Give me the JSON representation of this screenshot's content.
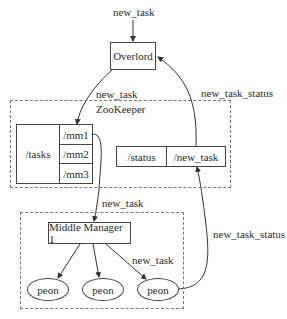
{
  "diagram": {
    "input_label": "new_task",
    "overlord": {
      "label": "Overlord"
    },
    "zookeeper": {
      "label": "ZooKeeper",
      "tasks_node": {
        "label": "/tasks",
        "children": [
          "/mm1",
          "/mm2",
          "/mm3"
        ]
      },
      "status_node": {
        "label": "/status",
        "child": "/new_task"
      }
    },
    "middle_manager_group": {
      "manager": {
        "label": "Middle Manager 1"
      },
      "peons": [
        "peon",
        "peon",
        "peon"
      ]
    },
    "edges": [
      {
        "from": "input",
        "to": "Overlord",
        "label": ""
      },
      {
        "from": "Overlord",
        "to": "/mm1",
        "label": "new_task"
      },
      {
        "from": "/mm1",
        "to": "Middle Manager 1",
        "label": "new_task"
      },
      {
        "from": "Middle Manager 1",
        "to": "peon 1",
        "label": ""
      },
      {
        "from": "Middle Manager 1",
        "to": "peon 2",
        "label": ""
      },
      {
        "from": "Middle Manager 1",
        "to": "peon 3",
        "label": "new_task"
      },
      {
        "from": "peon 3",
        "to": "/status/new_task",
        "label": "new_task_status"
      },
      {
        "from": "/status/new_task",
        "to": "Overlord",
        "label": "new_task_status"
      }
    ],
    "edge_labels": {
      "overlord_to_zk": "new_task",
      "zk_to_mm": "new_task",
      "mm_to_peon": "new_task",
      "peon_to_status": "new_task_status",
      "status_to_overlord": "new_task_status"
    }
  }
}
